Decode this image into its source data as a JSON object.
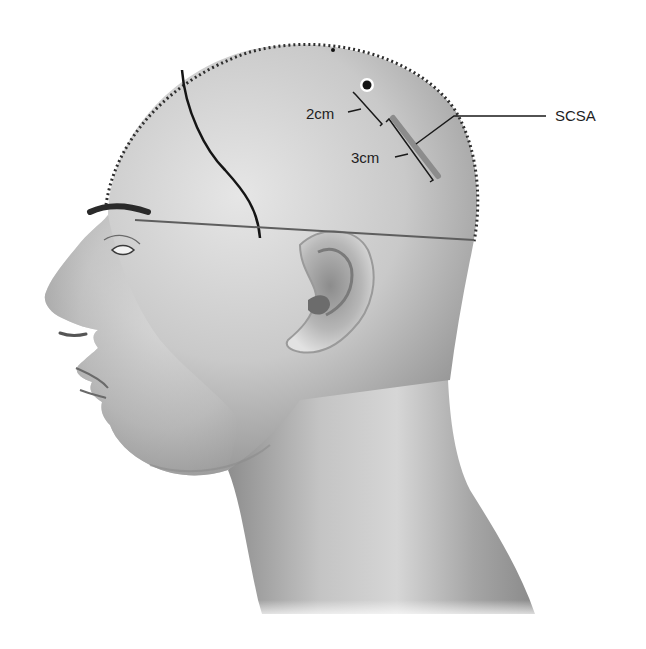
{
  "figure": {
    "style": "grayscale airbrushed medical illustration",
    "colors": {
      "background": "#ffffff",
      "skin_light": "#e2e2e2",
      "skin_mid": "#b8b8b8",
      "skin_dark": "#8a8a8a",
      "line_dark": "#1a1a1a",
      "line_gray": "#5e5e5e",
      "implant_bar": "#8c8c8c"
    }
  },
  "annotations": {
    "label_2cm": "2cm",
    "label_3cm": "3cm",
    "label_scsa": "SCSA"
  },
  "markings": {
    "hairline_dotted_outline": "dotted border along the top of the scalp",
    "incision_curve": "curved dark line from the top of the scalp down toward the temple",
    "horizontal_reference_line": "straight gray line from the eyebrow, above the ear, to the back of the head",
    "point_marker": "black dot with a white ring on the upper scalp",
    "scsa_bar": "gray rectangular bar on the posterior scalp, with 2cm and 3cm dimension brackets"
  }
}
